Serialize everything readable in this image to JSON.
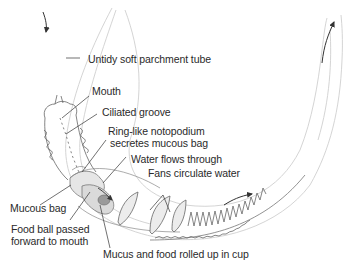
{
  "diagram": {
    "colors": {
      "line": "#555555",
      "tube": "#c8c8c8",
      "text": "#2a2a2a",
      "shade": "#d6d6d6",
      "foodball": "#9a9a9a"
    },
    "labels": {
      "tube": "Untidy soft parchment tube",
      "mouth": "Mouth",
      "ciliated_groove": "Ciliated groove",
      "notopodium_line1": "Ring-like notopodium",
      "notopodium_line2": "secretes mucous bag",
      "water_flows": "Water flows through",
      "fans": "Fans circulate water",
      "mucous_bag": "Mucous bag",
      "food_ball_line1": "Food ball passed",
      "food_ball_line2": "forward to mouth",
      "mucus_food": "Mucus and food rolled up in cup"
    },
    "arrows": [
      {
        "name": "water-inflow-arrow",
        "direction": "down"
      },
      {
        "name": "water-flow-arrow",
        "direction": "right"
      },
      {
        "name": "water-flow-tail-arrow",
        "direction": "up-right"
      },
      {
        "name": "water-outflow-arrow",
        "direction": "up"
      }
    ]
  }
}
